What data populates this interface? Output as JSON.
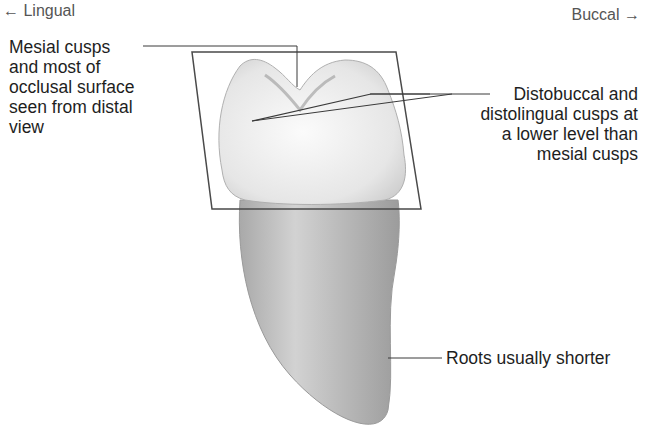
{
  "directions": {
    "left": "← Lingual",
    "right": "Buccal →"
  },
  "labels": {
    "mesial": "Mesial cusps\nand most of\nocclusal surface\nseen from distal\nview",
    "distal": "Distobuccal and\ndistolingual cusps at\na lower level than\nmesial cusps",
    "roots": "Roots usually shorter"
  },
  "colors": {
    "line": "#3a3a3a",
    "crown": "#ededed",
    "root": "#b8b8b8",
    "text": "#1e1e1e"
  }
}
